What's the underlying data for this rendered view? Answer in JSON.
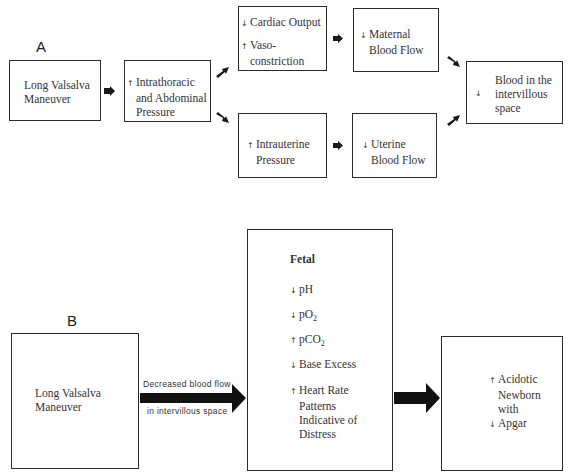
{
  "panel_a": {
    "label": "A",
    "start": {
      "line1": "Long Valsalva",
      "line2": "Maneuver"
    },
    "pressure": {
      "dir": "↑",
      "line1": "Intrathoracic",
      "line2": "and Abdominal",
      "line3": "Pressure"
    },
    "cardiac": {
      "dir1": "↓",
      "line1": "Cardiac Output",
      "dir2": "↑",
      "line2": "Vaso-",
      "line3": "constriction"
    },
    "maternal": {
      "dir": "↓",
      "line1": "Maternal",
      "line2": "Blood Flow"
    },
    "intrauterine": {
      "dir": "↑",
      "line1": "Intrauterine",
      "line2": "Pressure"
    },
    "uterine": {
      "dir": "↓",
      "line1": "Uterine",
      "line2": "Blood Flow"
    },
    "result": {
      "dir": "↓",
      "line1": "Blood in the",
      "line2": "intervillous",
      "line3": "space"
    }
  },
  "panel_b": {
    "label": "B",
    "start": {
      "line1": "Long Valsalva",
      "line2": "Maneuver"
    },
    "arrow_text": {
      "line1": "Decreased blood flow",
      "line2": "in intervillous space"
    },
    "fetal": {
      "title": "Fetal",
      "items": [
        {
          "dir": "↓",
          "text": "pH"
        },
        {
          "dir": "↓",
          "text": "pO",
          "sub": "2"
        },
        {
          "dir": "↑",
          "text": "pCO",
          "sub": "2"
        },
        {
          "dir": "↓",
          "text": "Base Excess"
        },
        {
          "dir": "↑",
          "line1": "Heart Rate",
          "line2": "Patterns",
          "line3": "Indicative of",
          "line4": "Distress"
        }
      ]
    },
    "newborn": {
      "dir1": "↑",
      "line1": "Acidotic",
      "line2": "Newborn",
      "line3": "with",
      "dir2": "↓",
      "line4": "Apgar"
    }
  }
}
